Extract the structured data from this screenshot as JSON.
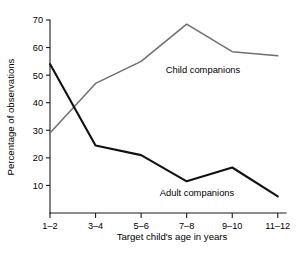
{
  "chart_data": {
    "type": "line",
    "title": "",
    "xlabel": "Target child's age in years",
    "ylabel": "Percentage of observations",
    "categories": [
      "1–2",
      "3–4",
      "5–6",
      "7–8",
      "9–10",
      "11–12"
    ],
    "series": [
      {
        "name": "Child companions",
        "values": [
          29,
          47,
          55,
          68.5,
          58.5,
          57
        ],
        "color": "#6e6e6e"
      },
      {
        "name": "Adult companions",
        "values": [
          54,
          24.5,
          21,
          11.5,
          16.5,
          6
        ],
        "color": "#111111"
      }
    ],
    "ylim": [
      0,
      70
    ],
    "yticks": [
      10,
      20,
      30,
      40,
      50,
      60,
      70
    ],
    "ytick_labels": [
      "10",
      "20",
      "30",
      "40",
      "50",
      "60",
      "70"
    ],
    "grid": false,
    "legend": "inline-annotations",
    "annotations": [
      {
        "text": "Child companions",
        "series": "Child companions"
      },
      {
        "text": "Adult companions",
        "series": "Adult companions"
      }
    ]
  },
  "axes": {
    "y_label": "Percentage of observations",
    "x_label": "Target child's age in years",
    "y_ticks": [
      "10",
      "20",
      "30",
      "40",
      "50",
      "60",
      "70"
    ],
    "x_ticks": [
      "1–2",
      "3–4",
      "5–6",
      "7–8",
      "9–10",
      "11–12"
    ]
  },
  "annotations": {
    "child_label": "Child companions",
    "adult_label": "Adult companions"
  }
}
